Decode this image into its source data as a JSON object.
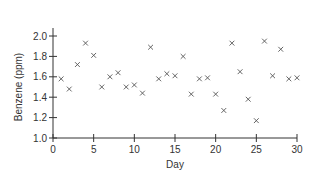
{
  "chart_data": {
    "type": "scatter",
    "title": "",
    "xlabel": "Day",
    "ylabel": "Benzene (ppm)",
    "xlim": [
      0,
      30
    ],
    "ylim": [
      1.0,
      2.0
    ],
    "xticks": [
      0,
      5,
      10,
      15,
      20,
      25,
      30
    ],
    "yticks": [
      "1.0",
      "1.2",
      "1.4",
      "1.6",
      "1.8",
      "2.0"
    ],
    "grid": false,
    "legend": null,
    "marker": "x",
    "marker_color": "#555555",
    "series": [
      {
        "name": "Benzene",
        "x": [
          1,
          2,
          3,
          4,
          5,
          6,
          7,
          8,
          9,
          10,
          11,
          12,
          13,
          14,
          15,
          16,
          17,
          18,
          19,
          20,
          21,
          22,
          23,
          24,
          25,
          26,
          27,
          28,
          29,
          30
        ],
        "y": [
          1.58,
          1.48,
          1.72,
          1.93,
          1.81,
          1.5,
          1.6,
          1.64,
          1.5,
          1.52,
          1.44,
          1.89,
          1.58,
          1.63,
          1.61,
          1.8,
          1.43,
          1.58,
          1.59,
          1.43,
          1.27,
          1.93,
          1.65,
          1.38,
          1.17,
          1.95,
          1.61,
          1.87,
          1.58,
          1.59
        ]
      }
    ]
  }
}
